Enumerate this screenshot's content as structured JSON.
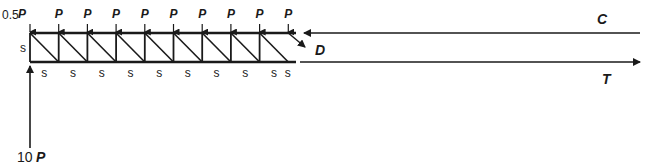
{
  "diagram": {
    "loads": {
      "end_load": {
        "coef": "0.5",
        "symbol": "P"
      },
      "panel_load_symbol": "P",
      "panel_load_count": 9,
      "reaction": {
        "coef": "10",
        "symbol": "P"
      }
    },
    "dimensions": {
      "panel_width_label": "s",
      "panel_height_label": "s",
      "panel_count": 9
    },
    "member_forces": {
      "compression": "C",
      "tension": "T",
      "diagonal": "D"
    },
    "colors": {
      "line": "#1a1a1a",
      "background": "#ffffff"
    }
  }
}
